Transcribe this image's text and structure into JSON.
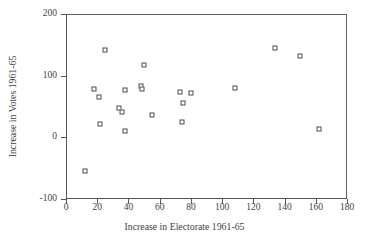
{
  "chart_data": {
    "type": "scatter",
    "title": "",
    "xlabel": "Increase in Electorate 1961-65",
    "ylabel": "Increase in Votes 1961-65",
    "xlim": [
      0,
      180
    ],
    "ylim": [
      -100,
      200
    ],
    "xticks": [
      0,
      20,
      40,
      60,
      80,
      100,
      120,
      140,
      160,
      180
    ],
    "yticks": [
      -100,
      0,
      100,
      200
    ],
    "xtick_labels": [
      "0",
      "20",
      "40",
      "60",
      "80",
      "100",
      "120",
      "140",
      "160",
      "180"
    ],
    "ytick_labels": [
      "-100",
      "0",
      "100",
      "200"
    ],
    "grid": false,
    "legend": null,
    "marker": "open-square",
    "marker_color": "#4a4a50",
    "points": [
      {
        "x": 12,
        "y": -55
      },
      {
        "x": 18,
        "y": 78
      },
      {
        "x": 21,
        "y": 65
      },
      {
        "x": 22,
        "y": 21
      },
      {
        "x": 25,
        "y": 142
      },
      {
        "x": 34,
        "y": 47
      },
      {
        "x": 36,
        "y": 41
      },
      {
        "x": 38,
        "y": 76
      },
      {
        "x": 38,
        "y": 10
      },
      {
        "x": 48,
        "y": 83
      },
      {
        "x": 49,
        "y": 78
      },
      {
        "x": 50,
        "y": 118
      },
      {
        "x": 55,
        "y": 36
      },
      {
        "x": 73,
        "y": 73
      },
      {
        "x": 74,
        "y": 25
      },
      {
        "x": 75,
        "y": 55
      },
      {
        "x": 80,
        "y": 72
      },
      {
        "x": 108,
        "y": 80
      },
      {
        "x": 134,
        "y": 145
      },
      {
        "x": 150,
        "y": 132
      },
      {
        "x": 162,
        "y": 14
      }
    ]
  },
  "figure": {
    "background": "#ffffff",
    "axis_color": "#55555a",
    "text_color": "#3f3f44"
  }
}
